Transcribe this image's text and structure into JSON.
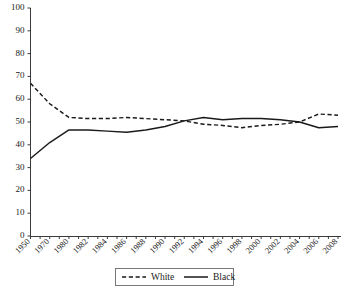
{
  "chart_data": {
    "type": "line",
    "title": "",
    "xlabel": "",
    "ylabel": "",
    "ylim": [
      0,
      100
    ],
    "yticks": [
      0,
      10,
      20,
      30,
      40,
      50,
      60,
      70,
      80,
      90,
      100
    ],
    "grid": false,
    "legend_position": "bottom-center",
    "categories": [
      "1950",
      "1970",
      "1980",
      "1982",
      "1984",
      "1986",
      "1988",
      "1990",
      "1992",
      "1994",
      "1996",
      "1998",
      "2000",
      "2002",
      "2004",
      "2006",
      "2008"
    ],
    "series": [
      {
        "name": "White",
        "style": "dashed",
        "color": "#1a1a1a",
        "values": [
          67,
          58,
          52,
          51.5,
          51.5,
          52,
          51.5,
          51,
          50.5,
          49,
          48.5,
          47.5,
          48.5,
          49,
          50,
          53.5,
          53
        ]
      },
      {
        "name": "Black",
        "style": "solid",
        "color": "#1a1a1a",
        "values": [
          34,
          41,
          46.5,
          46.5,
          46,
          45.5,
          46.5,
          48,
          50.5,
          52,
          51,
          51.5,
          51.5,
          51,
          50,
          47.5,
          48
        ]
      }
    ],
    "legend": [
      {
        "label": "White",
        "style": "dashed"
      },
      {
        "label": "Black",
        "style": "solid"
      }
    ]
  },
  "axis": {
    "y_tick_labels": [
      "100",
      "90",
      "80",
      "70",
      "60",
      "50",
      "40",
      "30",
      "20",
      "10",
      "0"
    ],
    "x_tick_labels": [
      "1950",
      "1970",
      "1980",
      "1982",
      "1984",
      "1986",
      "1988",
      "1990",
      "1992",
      "1994",
      "1996",
      "1998",
      "2000",
      "2002",
      "2004",
      "2006",
      "2008"
    ]
  },
  "legend": {
    "white_label": "White",
    "black_label": "Black"
  },
  "colors": {
    "line": "#1a1a1a",
    "axis": "#3b3b3b",
    "legend_border": "#6a6a6a",
    "background": "#ffffff"
  }
}
